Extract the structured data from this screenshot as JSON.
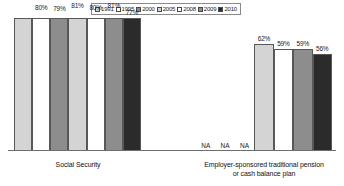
{
  "chart_data": {
    "type": "bar",
    "title": "",
    "xlabel": "",
    "ylabel": "",
    "ylim": [
      0,
      100
    ],
    "grid": false,
    "legend_position": "top-center",
    "value_suffix": "%",
    "na_text": "NA",
    "categories": [
      "Social Security",
      "Employer-sponsored traditional pension or cash balance plan"
    ],
    "series": [
      {
        "name": "1991",
        "values": [
          88,
          null
        ],
        "swatch": "#d4d4d4"
      },
      {
        "name": "1995",
        "values": [
          80,
          null
        ],
        "swatch": "#ffffff"
      },
      {
        "name": "2000",
        "values": [
          79,
          null
        ],
        "swatch": "#8d8d8d"
      },
      {
        "name": "2005",
        "values": [
          81,
          62
        ],
        "swatch": "#d4d4d4"
      },
      {
        "name": "2008",
        "values": [
          80,
          59
        ],
        "swatch": "#ffffff"
      },
      {
        "name": "2009",
        "values": [
          81,
          59
        ],
        "swatch": "#8d8d8d"
      },
      {
        "name": "2010",
        "values": [
          77,
          56
        ],
        "swatch": "#2b2b2b"
      }
    ]
  },
  "legend": {
    "entries": [
      {
        "label": "1991"
      },
      {
        "label": "1995"
      },
      {
        "label": "2000"
      },
      {
        "label": "2005"
      },
      {
        "label": "2008"
      },
      {
        "label": "2009"
      },
      {
        "label": "2010"
      }
    ]
  },
  "axis": {
    "category_labels": [
      {
        "lines": [
          "Social Security"
        ]
      },
      {
        "lines": [
          "Employer-sponsored traditional pension",
          "or cash balance plan"
        ]
      }
    ]
  }
}
